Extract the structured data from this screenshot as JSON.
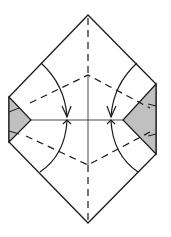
{
  "diagram": {
    "type": "origami-fold-step",
    "colors": {
      "line": "#1a1a1a",
      "fill_gray": "#c0c0c0",
      "paper": "#ffffff"
    },
    "elements": [
      "hexagonal-paper-outline",
      "gray-flaps-left-right",
      "valley-fold-lines-dashed",
      "center-crease",
      "curved-fold-arrows"
    ]
  }
}
